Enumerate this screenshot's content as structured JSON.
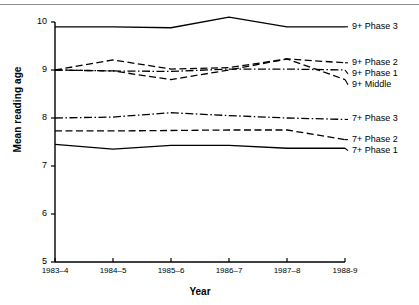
{
  "chart_data": {
    "type": "line",
    "title": "",
    "xlabel": "Year",
    "ylabel": "Mean reading age",
    "categories": [
      "1983–4",
      "1984–5",
      "1985–6",
      "1986–7",
      "1987–8",
      "1988-9"
    ],
    "x_tick_labels": [
      "1983–4",
      "1984–5",
      "1985–6",
      "1986–7",
      "1987–8",
      "1988-9"
    ],
    "y_tick_labels": [
      "10",
      "9",
      "8",
      "7",
      "6",
      "5"
    ],
    "y_ticks": [
      10,
      9,
      8,
      7,
      6,
      5
    ],
    "ylim": [
      5,
      10.4
    ],
    "grid": false,
    "legend_position": "right-of-lines",
    "series": [
      {
        "name": "9+ Phase 3",
        "label": "9+ Phase 3",
        "style": "solid",
        "values": [
          9.9,
          9.9,
          9.88,
          10.1,
          9.9,
          9.9
        ]
      },
      {
        "name": "9+ Phase 2",
        "label": "9+ Phase 2",
        "style": "dashed",
        "values": [
          9.0,
          9.21,
          9.02,
          9.05,
          9.23,
          9.15
        ]
      },
      {
        "name": "9+ Phase 1",
        "label": "9+ Phase 1",
        "style": "dash-dot",
        "values": [
          9.0,
          8.98,
          8.97,
          9.02,
          9.02,
          9.0
        ]
      },
      {
        "name": "9+ Middle",
        "label": "9+ Middle",
        "style": "dashed",
        "values": [
          9.0,
          8.98,
          8.8,
          9.0,
          9.23,
          8.8
        ]
      },
      {
        "name": "7+ Phase 3",
        "label": "7+ Phase 3",
        "style": "dash-dot",
        "values": [
          8.0,
          8.02,
          8.11,
          8.05,
          8.0,
          7.97
        ]
      },
      {
        "name": "7+ Phase 2",
        "label": "7+ Phase 2",
        "style": "dashed",
        "values": [
          7.73,
          7.73,
          7.74,
          7.75,
          7.75,
          7.55
        ]
      },
      {
        "name": "7+ Phase 1",
        "label": "7+ Phase 1",
        "style": "solid",
        "values": [
          7.45,
          7.35,
          7.43,
          7.43,
          7.37,
          7.37
        ]
      }
    ]
  },
  "axes": {
    "y_title": "Mean reading age",
    "x_title": "Year"
  }
}
